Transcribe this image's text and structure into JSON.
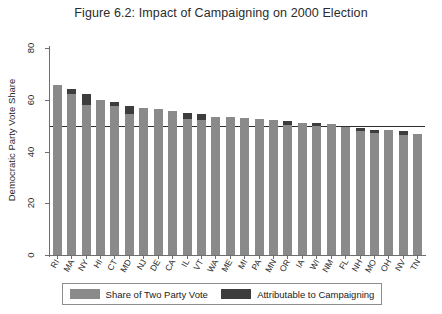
{
  "chart_data": {
    "type": "bar",
    "title": "Figure 6.2: Impact of Campaigning on 2000 Election",
    "xlabel": "",
    "ylabel": "Democratic Party Vote Share",
    "ylim": [
      0,
      80
    ],
    "yticks": [
      0,
      20,
      40,
      60,
      80
    ],
    "grid": false,
    "legend_position": "bottom",
    "reference_line": 50,
    "categories": [
      "RI",
      "MA",
      "NY",
      "HI",
      "CT",
      "MD",
      "NJ",
      "DE",
      "CA",
      "IL",
      "VT",
      "WA",
      "ME",
      "MI",
      "PA",
      "MN",
      "OR",
      "IA",
      "WI",
      "NM",
      "FL",
      "NH",
      "MO",
      "OH",
      "NV",
      "TN"
    ],
    "series": [
      {
        "name": "Share of Two Party Vote",
        "color": "#8a8a8a",
        "values": [
          65.6,
          64.2,
          62.3,
          59.8,
          59.2,
          57.5,
          57.0,
          56.5,
          55.5,
          55.0,
          54.5,
          53.5,
          53.2,
          52.8,
          52.5,
          52.2,
          51.8,
          51.2,
          51.0,
          50.5,
          49.5,
          49.0,
          48.5,
          48.2,
          47.8,
          46.8
        ]
      },
      {
        "name": "Attributable to Campaigning",
        "color": "#3d3d3d",
        "values": [
          0.0,
          2.0,
          4.2,
          0.0,
          1.5,
          3.2,
          0.0,
          0.0,
          0.0,
          2.6,
          2.2,
          0.0,
          0.0,
          0.0,
          0.0,
          0.0,
          1.4,
          0.0,
          1.3,
          0.0,
          0.0,
          1.2,
          1.2,
          0.0,
          1.5,
          0.0
        ]
      }
    ]
  },
  "legend": {
    "items": [
      {
        "label": "Share of Two Party Vote"
      },
      {
        "label": "Attributable to Campaigning"
      }
    ]
  }
}
